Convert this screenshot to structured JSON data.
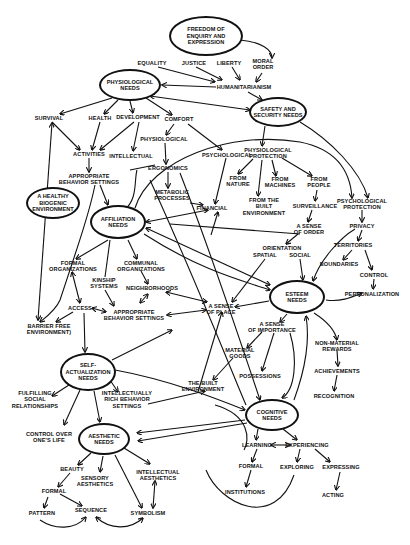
{
  "diagram": {
    "ellipse_nodes": [
      {
        "id": "freedom",
        "label": "FREEDOM OF\nENQUIRY AND\nEXPRESSION",
        "x": 206,
        "y": 36,
        "w": 74,
        "h": 40
      },
      {
        "id": "physiological",
        "label": "PHYSIOLOGICAL\nNEEDS",
        "x": 130,
        "y": 85,
        "w": 62,
        "h": 32
      },
      {
        "id": "safety",
        "label": "SAFETY AND\nSECURITY NEEDS",
        "x": 278,
        "y": 112,
        "w": 58,
        "h": 30
      },
      {
        "id": "healthy_env",
        "label": "A HEALTHY\nBIOGENIC\nENVIRONMENT",
        "x": 53,
        "y": 203,
        "w": 54,
        "h": 32
      },
      {
        "id": "affiliation",
        "label": "AFFILIATION\nNEEDS",
        "x": 118,
        "y": 222,
        "w": 56,
        "h": 34
      },
      {
        "id": "esteem",
        "label": "ESTEEM\nNEEDS",
        "x": 297,
        "y": 297,
        "w": 56,
        "h": 34
      },
      {
        "id": "self_actualization",
        "label": "SELF-\nACTUALIZATION\nNEEDS",
        "x": 88,
        "y": 372,
        "w": 56,
        "h": 38
      },
      {
        "id": "cognitive",
        "label": "COGNITIVE\nNEEDS",
        "x": 272,
        "y": 415,
        "w": 54,
        "h": 32
      },
      {
        "id": "aesthetic",
        "label": "AESTHETIC\nNEEDS",
        "x": 104,
        "y": 439,
        "w": 52,
        "h": 32
      }
    ],
    "text_nodes": [
      {
        "id": "equality",
        "label": "EQUALITY",
        "x": 152,
        "y": 63
      },
      {
        "id": "justice",
        "label": "JUSTICE",
        "x": 194,
        "y": 63
      },
      {
        "id": "liberty",
        "label": "LIBERTY",
        "x": 229,
        "y": 63
      },
      {
        "id": "moral_order",
        "label": "MORAL\nORDER",
        "x": 263,
        "y": 64
      },
      {
        "id": "humanitarianism",
        "label": "HUMANITARIANISM",
        "x": 244,
        "y": 87
      },
      {
        "id": "survival",
        "label": "SURVIVAL",
        "x": 49,
        "y": 118
      },
      {
        "id": "health",
        "label": "HEALTH",
        "x": 100,
        "y": 118
      },
      {
        "id": "development",
        "label": "DEVELOPMENT",
        "x": 138,
        "y": 117
      },
      {
        "id": "comfort",
        "label": "COMFORT",
        "x": 179,
        "y": 119
      },
      {
        "id": "physiological_comfort",
        "label": "PHYSIOLOGICAL",
        "x": 164,
        "y": 139
      },
      {
        "id": "psychological_comfort",
        "label": "PSYCHOLOGICAL",
        "x": 227,
        "y": 155
      },
      {
        "id": "activities",
        "label": "ACTIVITIES",
        "x": 89,
        "y": 154
      },
      {
        "id": "intellectual",
        "label": "INTELLECTUAL",
        "x": 131,
        "y": 156
      },
      {
        "id": "ergonomics",
        "label": "ERGONOMICS",
        "x": 168,
        "y": 168
      },
      {
        "id": "appropriate_behavior_1",
        "label": "APPROPRIATE\nBEHAVIOR SETTINGS",
        "x": 89,
        "y": 179
      },
      {
        "id": "metabolic",
        "label": "METABOLIC\nPROCESSES",
        "x": 172,
        "y": 195
      },
      {
        "id": "financial",
        "label": "FINANCIAL",
        "x": 212,
        "y": 208
      },
      {
        "id": "phys_protection",
        "label": "PHYSIOLOGICAL\nPROTECTION",
        "x": 268,
        "y": 153
      },
      {
        "id": "from_nature",
        "label": "FROM\nNATURE",
        "x": 238,
        "y": 181
      },
      {
        "id": "from_machines",
        "label": "FROM\nMACHINES",
        "x": 280,
        "y": 182
      },
      {
        "id": "from_people",
        "label": "FROM\nPEOPLE",
        "x": 319,
        "y": 182
      },
      {
        "id": "from_built",
        "label": "FROM THE\nBUILT\nENVIRONMENT",
        "x": 264,
        "y": 207
      },
      {
        "id": "surveillance",
        "label": "SURVEILLANCE",
        "x": 315,
        "y": 206
      },
      {
        "id": "psych_protection",
        "label": "PSYCHOLOGICAL\nPROTECTION",
        "x": 362,
        "y": 204
      },
      {
        "id": "sense_order",
        "label": "A SENSE\nOF ORDER",
        "x": 309,
        "y": 229
      },
      {
        "id": "privacy",
        "label": "PRIVACY",
        "x": 362,
        "y": 226
      },
      {
        "id": "orientation",
        "label": "ORIENTATION",
        "x": 282,
        "y": 248
      },
      {
        "id": "spatial",
        "label": "SPATIAL",
        "x": 265,
        "y": 255
      },
      {
        "id": "social",
        "label": "SOCIAL",
        "x": 300,
        "y": 255
      },
      {
        "id": "territories",
        "label": "TERRITORIES",
        "x": 353,
        "y": 245
      },
      {
        "id": "boundaries",
        "label": "BOUNDARIES",
        "x": 339,
        "y": 264
      },
      {
        "id": "control",
        "label": "CONTROL",
        "x": 374,
        "y": 275
      },
      {
        "id": "personalization",
        "label": "PERSONALIZATION",
        "x": 372,
        "y": 294
      },
      {
        "id": "formal_org",
        "label": "FORMAL\nORGANIZATIONS",
        "x": 73,
        "y": 266
      },
      {
        "id": "communal_org",
        "label": "COMMUNAL\nORGANIZATIONS",
        "x": 141,
        "y": 266
      },
      {
        "id": "kinship",
        "label": "KINSHIP\nSYSTEMS",
        "x": 104,
        "y": 283
      },
      {
        "id": "neighborhoods",
        "label": "NEIGHBORHOODS",
        "x": 152,
        "y": 288
      },
      {
        "id": "access",
        "label": "ACCESS",
        "x": 80,
        "y": 308
      },
      {
        "id": "appropriate_behavior_2",
        "label": "APPROPRIATE\nBEHAVIOR SETTINGS",
        "x": 134,
        "y": 315
      },
      {
        "id": "sense_place",
        "label": "A SENSE\nOF PLACE",
        "x": 221,
        "y": 309
      },
      {
        "id": "barrier_free",
        "label": "BARRIER FREE\nENVIRONMENT)",
        "x": 49,
        "y": 329
      },
      {
        "id": "sense_importance",
        "label": "A SENSE\nOF IMPORTANCE",
        "x": 272,
        "y": 327
      },
      {
        "id": "non_material",
        "label": "NON-MATERIAL\nREWARDS",
        "x": 337,
        "y": 346
      },
      {
        "id": "material_goods",
        "label": "MATERIAL\nGOODS",
        "x": 240,
        "y": 353
      },
      {
        "id": "achievements",
        "label": "ACHIEVEMENTS",
        "x": 337,
        "y": 371
      },
      {
        "id": "possessions",
        "label": "POSSESSIONS",
        "x": 260,
        "y": 376
      },
      {
        "id": "built_env",
        "label": "THE BUILT\nENVIRONMENT",
        "x": 203,
        "y": 386
      },
      {
        "id": "recognition",
        "label": "RECOGNITION",
        "x": 334,
        "y": 396
      },
      {
        "id": "fulfilling",
        "label": "FULFILLING\nSOCIAL\nRELATIONSHIPS",
        "x": 35,
        "y": 400
      },
      {
        "id": "intellectually_rich",
        "label": "INTELLECTUALLY\nRICH BEHAVIOR\nSETTINGS",
        "x": 127,
        "y": 400
      },
      {
        "id": "control_life",
        "label": "CONTROL OVER\nONE'S LIFE",
        "x": 49,
        "y": 437
      },
      {
        "id": "learning",
        "label": "LEARNING",
        "x": 257,
        "y": 445
      },
      {
        "id": "experiencing",
        "label": "EXPERIENCING",
        "x": 307,
        "y": 445
      },
      {
        "id": "beauty",
        "label": "BEAUTY",
        "x": 72,
        "y": 469
      },
      {
        "id": "sensory",
        "label": "SENSORY\nAESTHETICS",
        "x": 95,
        "y": 481
      },
      {
        "id": "intellectual_aes",
        "label": "INTELLECTUAL\nAESTHETICS",
        "x": 158,
        "y": 475
      },
      {
        "id": "formal_learning",
        "label": "FORMAL",
        "x": 251,
        "y": 466
      },
      {
        "id": "exploring",
        "label": "EXPLORING",
        "x": 297,
        "y": 467
      },
      {
        "id": "expressing",
        "label": "EXPRESSING",
        "x": 341,
        "y": 467
      },
      {
        "id": "formal_aes",
        "label": "FORMAL",
        "x": 54,
        "y": 491
      },
      {
        "id": "institutions",
        "label": "INSTITUTIONS",
        "x": 245,
        "y": 492
      },
      {
        "id": "acting",
        "label": "ACTING",
        "x": 333,
        "y": 495
      },
      {
        "id": "pattern",
        "label": "PATTERN",
        "x": 42,
        "y": 513
      },
      {
        "id": "sequence",
        "label": "SEQUENCE",
        "x": 91,
        "y": 510
      },
      {
        "id": "symbolism",
        "label": "SYMBOLISM",
        "x": 148,
        "y": 513
      }
    ],
    "edges": [
      {
        "d": "M240,40 C262,42 272,50 272,58",
        "arrow": "end"
      },
      {
        "d": "M158,67 L215,82",
        "arrow": "end"
      },
      {
        "d": "M196,67 L222,80",
        "arrow": "end"
      },
      {
        "d": "M232,67 L240,80",
        "arrow": "end"
      },
      {
        "d": "M262,73 L256,82",
        "arrow": "end"
      },
      {
        "d": "M216,87 L162,85",
        "arrow": "end"
      },
      {
        "d": "M248,92 L262,100",
        "arrow": "end"
      },
      {
        "d": "M150,96 L250,110",
        "arrow": "both"
      },
      {
        "d": "M112,98 L60,114",
        "arrow": "end"
      },
      {
        "d": "M118,100 L104,114",
        "arrow": "end"
      },
      {
        "d": "M130,101 L133,113",
        "arrow": "end"
      },
      {
        "d": "M146,98 L172,115",
        "arrow": "end"
      },
      {
        "d": "M52,122 L80,150",
        "arrow": "end"
      },
      {
        "d": "M100,122 L92,150",
        "arrow": "end"
      },
      {
        "d": "M134,122 L100,150",
        "arrow": "end"
      },
      {
        "d": "M139,122 L133,151",
        "arrow": "end"
      },
      {
        "d": "M174,124 L166,135",
        "arrow": "end"
      },
      {
        "d": "M188,124 L222,150",
        "arrow": "end"
      },
      {
        "d": "M165,143 L166,164",
        "arrow": "end"
      },
      {
        "d": "M168,172 L168,188",
        "arrow": "end"
      },
      {
        "d": "M89,158 L89,172",
        "arrow": "end"
      },
      {
        "d": "M52,123 L38,320",
        "arrow": "both"
      },
      {
        "d": "M100,185 L108,205",
        "arrow": "end"
      },
      {
        "d": "M95,185 C90,210 80,240 60,300 C56,310 45,318 40,322",
        "arrow": "end"
      },
      {
        "d": "M155,165 L130,170",
        "arrow": "none"
      },
      {
        "d": "M137,170 C134,180 138,200 124,210",
        "arrow": "none"
      },
      {
        "d": "M190,203 L203,205",
        "arrow": "end"
      },
      {
        "d": "M265,126 L262,146",
        "arrow": "end"
      },
      {
        "d": "M135,208 C150,160 230,130 300,142 C330,148 350,165 352,198",
        "arrow": "end"
      },
      {
        "d": "M300,122 C330,140 360,170 368,198",
        "arrow": "end"
      },
      {
        "d": "M253,159 L238,174",
        "arrow": "end"
      },
      {
        "d": "M272,160 L276,176",
        "arrow": "end"
      },
      {
        "d": "M282,158 L312,176",
        "arrow": "end"
      },
      {
        "d": "M262,160 L258,196",
        "arrow": "end"
      },
      {
        "d": "M317,190 L315,201",
        "arrow": "end"
      },
      {
        "d": "M312,210 L308,222",
        "arrow": "end"
      },
      {
        "d": "M226,158 L215,204",
        "arrow": "end"
      },
      {
        "d": "M211,235 L218,212",
        "arrow": "end"
      },
      {
        "d": "M362,210 L362,222",
        "arrow": "end"
      },
      {
        "d": "M362,230 L358,241",
        "arrow": "end"
      },
      {
        "d": "M352,250 L343,260",
        "arrow": "end"
      },
      {
        "d": "M365,250 L372,270",
        "arrow": "end"
      },
      {
        "d": "M374,279 L373,289",
        "arrow": "end"
      },
      {
        "d": "M326,300 C340,302 350,298 362,293",
        "arrow": "end"
      },
      {
        "d": "M355,229 C340,238 320,260 313,281",
        "arrow": "end"
      },
      {
        "d": "M298,234 L286,244",
        "arrow": "end"
      },
      {
        "d": "M300,259 L303,280",
        "arrow": "end"
      },
      {
        "d": "M265,259 L232,302",
        "arrow": "end"
      },
      {
        "d": "M170,224 L300,234",
        "arrow": "none"
      },
      {
        "d": "M146,222 L208,210",
        "arrow": "both"
      },
      {
        "d": "M146,228 L270,285",
        "arrow": "both"
      },
      {
        "d": "M144,234 C200,270 240,280 270,290",
        "arrow": "end"
      },
      {
        "d": "M108,240 L76,259",
        "arrow": "end"
      },
      {
        "d": "M110,240 L105,277",
        "arrow": "none"
      },
      {
        "d": "M128,240 L137,259",
        "arrow": "end"
      },
      {
        "d": "M141,271 L148,284",
        "arrow": "end"
      },
      {
        "d": "M72,272 L80,303",
        "arrow": "both"
      },
      {
        "d": "M105,290 L114,306",
        "arrow": "end"
      },
      {
        "d": "M140,303 L148,294",
        "arrow": "both"
      },
      {
        "d": "M92,308 L106,312",
        "arrow": "both"
      },
      {
        "d": "M73,312 L56,322",
        "arrow": "end"
      },
      {
        "d": "M166,292 L207,302",
        "arrow": "both"
      },
      {
        "d": "M167,315 L206,310",
        "arrow": "both"
      },
      {
        "d": "M84,313 L85,352",
        "arrow": "end"
      },
      {
        "d": "M269,301 L235,307",
        "arrow": "end"
      },
      {
        "d": "M287,314 L280,322",
        "arrow": "end"
      },
      {
        "d": "M314,313 C325,320 335,330 337,340",
        "arrow": "end"
      },
      {
        "d": "M262,332 L247,348",
        "arrow": "end"
      },
      {
        "d": "M274,333 L262,371",
        "arrow": "end"
      },
      {
        "d": "M290,333 C298,360 295,390 282,398",
        "arrow": "end"
      },
      {
        "d": "M294,400 C305,370 310,340 306,316",
        "arrow": "end"
      },
      {
        "d": "M337,350 L338,366",
        "arrow": "end"
      },
      {
        "d": "M337,375 L334,391",
        "arrow": "end"
      },
      {
        "d": "M233,358 L213,380",
        "arrow": "end"
      },
      {
        "d": "M198,392 L222,312",
        "arrow": "end"
      },
      {
        "d": "M148,404 L205,391",
        "arrow": "end"
      },
      {
        "d": "M180,173 C210,250 240,340 260,400",
        "arrow": "end"
      },
      {
        "d": "M150,180 C200,290 235,380 246,405",
        "arrow": "none"
      },
      {
        "d": "M112,360 L172,330",
        "arrow": "end"
      },
      {
        "d": "M72,383 L52,396",
        "arrow": "end"
      },
      {
        "d": "M110,380 L118,392",
        "arrow": "end"
      },
      {
        "d": "M115,370 C170,380 220,400 245,410",
        "arrow": "end"
      },
      {
        "d": "M80,390 L64,425",
        "arrow": "end"
      },
      {
        "d": "M94,391 L100,422",
        "arrow": "end"
      },
      {
        "d": "M245,420 L137,433",
        "arrow": "end"
      },
      {
        "d": "M247,423 L138,441",
        "arrow": "end"
      },
      {
        "d": "M215,405 C250,415 250,440 244,450",
        "arrow": "none"
      },
      {
        "d": "M258,429 L256,440",
        "arrow": "end"
      },
      {
        "d": "M283,429 L297,440",
        "arrow": "end"
      },
      {
        "d": "M271,445 L290,445",
        "arrow": "both"
      },
      {
        "d": "M300,449 L297,462",
        "arrow": "end"
      },
      {
        "d": "M315,449 L330,462",
        "arrow": "end"
      },
      {
        "d": "M257,449 L252,462",
        "arrow": "end"
      },
      {
        "d": "M251,470 L246,487",
        "arrow": "end"
      },
      {
        "d": "M340,472 L336,490",
        "arrow": "end"
      },
      {
        "d": "M206,470 C220,505 275,530 294,475",
        "arrow": "none"
      },
      {
        "d": "M91,453 L78,465",
        "arrow": "end"
      },
      {
        "d": "M103,456 L100,472",
        "arrow": "end"
      },
      {
        "d": "M115,455 L142,508",
        "arrow": "end"
      },
      {
        "d": "M124,448 L150,464",
        "arrow": "end"
      },
      {
        "d": "M70,473 L58,487",
        "arrow": "end"
      },
      {
        "d": "M60,494 L82,506",
        "arrow": "end"
      },
      {
        "d": "M48,497 L44,508",
        "arrow": "end"
      },
      {
        "d": "M155,481 L153,508",
        "arrow": "both"
      },
      {
        "d": "M40,520 C55,530 75,530 86,517",
        "arrow": "end"
      },
      {
        "d": "M96,517 C110,530 130,530 143,518",
        "arrow": "both"
      }
    ]
  }
}
